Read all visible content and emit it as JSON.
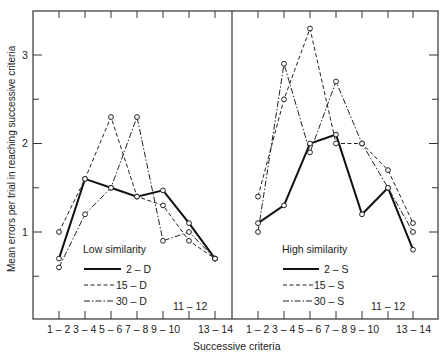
{
  "chart_data": [
    {
      "type": "line",
      "panel": "left",
      "legend_title": "Low similarity",
      "xlabel": "Successive criteria",
      "ylabel": "Mean errors per trial in reaching successive criteria",
      "categories": [
        "1-2",
        "3-4",
        "5-6",
        "7-8",
        "9-10",
        "11-12",
        "13-14"
      ],
      "ylim": [
        0,
        3.5
      ],
      "yticks": [
        1,
        2,
        3
      ],
      "series": [
        {
          "name": "2 - D",
          "style": "solid",
          "values": [
            0.7,
            1.6,
            1.5,
            1.4,
            1.47,
            1.1,
            0.7
          ]
        },
        {
          "name": "15 - D",
          "style": "dashed",
          "values": [
            1.0,
            1.6,
            2.3,
            1.4,
            1.3,
            0.9,
            0.7
          ]
        },
        {
          "name": "30 - D",
          "style": "dashdot",
          "values": [
            0.6,
            1.2,
            1.5,
            2.3,
            0.9,
            1.0,
            0.7
          ]
        }
      ]
    },
    {
      "type": "line",
      "panel": "right",
      "legend_title": "High similarity",
      "xlabel": "Successive criteria",
      "ylabel": "Mean errors per trial in reaching successive criteria",
      "categories": [
        "1-2",
        "3-4",
        "5-6",
        "7-8",
        "9-10",
        "11-12",
        "13-14"
      ],
      "ylim": [
        0,
        3.5
      ],
      "yticks": [
        1,
        2,
        3
      ],
      "series": [
        {
          "name": "2 - S",
          "style": "solid",
          "values": [
            1.1,
            1.3,
            2.0,
            2.1,
            1.2,
            1.5,
            0.8
          ]
        },
        {
          "name": "15 - S",
          "style": "dashed",
          "values": [
            1.4,
            2.5,
            3.3,
            2.0,
            2.0,
            1.7,
            1.1
          ]
        },
        {
          "name": "30 - S",
          "style": "dashdot",
          "values": [
            1.0,
            2.9,
            1.9,
            2.7,
            2.0,
            1.5,
            1.0
          ]
        }
      ]
    }
  ],
  "axis": {
    "xlabel": "Successive criteria",
    "ylabel": "Mean errors per trial in reaching successive criteria",
    "ytick_labels": [
      "1",
      "2",
      "3"
    ],
    "xtick_labels_bottom": [
      "1 – 2",
      "3 – 4",
      "5 – 6",
      "7 – 8",
      "9 – 10",
      "13 – 14"
    ],
    "xtick_label_inside": "11 – 12"
  },
  "legend_left": {
    "title": "Low similarity",
    "items": [
      "2 – D",
      "15 – D",
      "30 – D"
    ]
  },
  "legend_right": {
    "title": "High similarity",
    "items": [
      "2 – S",
      "15 – S",
      "30 – S"
    ]
  }
}
